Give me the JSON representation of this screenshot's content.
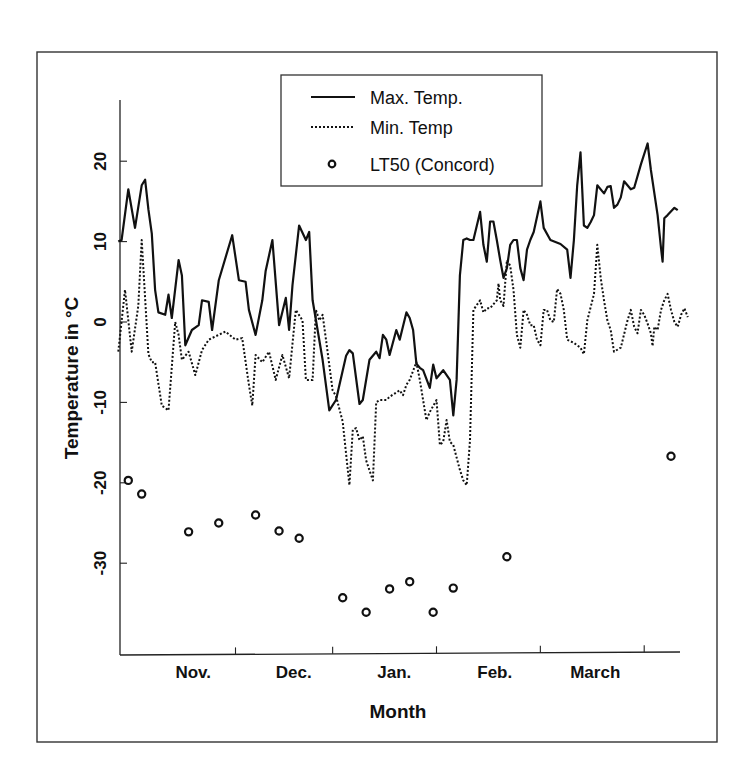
{
  "chart_data": {
    "type": "line",
    "title": "",
    "xlabel": "Month",
    "ylabel": "Temperature in °C",
    "ylim": [
      -40,
      28
    ],
    "yticks": [
      20,
      10,
      0,
      -10,
      -20,
      -30
    ],
    "x_unit": "day index (0 = 1 Nov)",
    "xlim": [
      -4,
      162
    ],
    "month_boundaries": [
      30,
      59,
      90,
      121,
      152
    ],
    "month_labels": [
      {
        "label": "Nov.",
        "x": 15
      },
      {
        "label": "Dec.",
        "x": 45
      },
      {
        "label": "Jan.",
        "x": 75
      },
      {
        "label": "Feb.",
        "x": 105
      },
      {
        "label": "March",
        "x": 135
      }
    ],
    "grid": false,
    "legend_position": "top-center",
    "legend": [
      {
        "label": "Max. Temp.",
        "style": "solid"
      },
      {
        "label": "Min. Temp",
        "style": "dotted"
      },
      {
        "label": "LT50 (Concord)",
        "style": "open-circle"
      }
    ],
    "series": [
      {
        "name": "Max. Temp.",
        "style": "solid",
        "points": [
          [
            -5,
            10
          ],
          [
            -4,
            10.2
          ],
          [
            -2,
            16.5
          ],
          [
            0,
            11.7
          ],
          [
            2,
            17
          ],
          [
            3,
            17.7
          ],
          [
            4,
            14
          ],
          [
            5,
            11
          ],
          [
            6,
            4
          ],
          [
            7,
            1.2
          ],
          [
            9,
            0.9
          ],
          [
            10,
            3.4
          ],
          [
            11,
            0.5
          ],
          [
            13,
            7.7
          ],
          [
            14,
            5.8
          ],
          [
            15,
            -2.9
          ],
          [
            17,
            -1
          ],
          [
            19,
            -0.4
          ],
          [
            20,
            2.7
          ],
          [
            22,
            2.5
          ],
          [
            23,
            -1
          ],
          [
            25,
            5.2
          ],
          [
            29,
            10.8
          ],
          [
            31,
            5.2
          ],
          [
            33,
            5
          ],
          [
            34,
            1.5
          ],
          [
            36,
            -1.6
          ],
          [
            38,
            2.7
          ],
          [
            39,
            6.3
          ],
          [
            41,
            10.2
          ],
          [
            43,
            -0.4
          ],
          [
            45,
            3
          ],
          [
            46,
            -1
          ],
          [
            47,
            4.6
          ],
          [
            49,
            12
          ],
          [
            51,
            10.2
          ],
          [
            52,
            11.2
          ],
          [
            53,
            2.7
          ],
          [
            56,
            -4.7
          ],
          [
            58,
            -11
          ],
          [
            60,
            -9.7
          ],
          [
            63,
            -4.2
          ],
          [
            64,
            -3.5
          ],
          [
            65,
            -3.9
          ],
          [
            67,
            -10.2
          ],
          [
            68,
            -9.7
          ],
          [
            70,
            -4.7
          ],
          [
            72,
            -3.7
          ],
          [
            73,
            -4.5
          ],
          [
            74,
            -1.6
          ],
          [
            75,
            -2.2
          ],
          [
            76,
            -4.1
          ],
          [
            78,
            -1
          ],
          [
            79,
            -2.2
          ],
          [
            81,
            1.2
          ],
          [
            82,
            0.5
          ],
          [
            83,
            -1
          ],
          [
            84,
            -5.2
          ],
          [
            85,
            -5.7
          ],
          [
            86,
            -6
          ],
          [
            88,
            -8.2
          ],
          [
            89,
            -5.3
          ],
          [
            90,
            -7
          ],
          [
            92,
            -6
          ],
          [
            94,
            -7.2
          ],
          [
            95,
            -11.6
          ],
          [
            96,
            -7.2
          ],
          [
            97,
            5.8
          ],
          [
            98,
            10.2
          ],
          [
            99,
            10.4
          ],
          [
            100,
            10.2
          ],
          [
            101,
            10.2
          ],
          [
            103,
            13.7
          ],
          [
            104,
            9.6
          ],
          [
            105,
            7.5
          ],
          [
            106,
            12.5
          ],
          [
            107,
            12.5
          ],
          [
            108,
            10.2
          ],
          [
            109,
            7.7
          ],
          [
            110,
            5.5
          ],
          [
            111,
            6.7
          ],
          [
            112,
            9.6
          ],
          [
            113,
            10.2
          ],
          [
            114,
            10.2
          ],
          [
            115,
            6.7
          ],
          [
            116,
            5.2
          ],
          [
            117,
            9
          ],
          [
            118,
            10.2
          ],
          [
            119,
            11.2
          ],
          [
            121,
            15
          ],
          [
            122,
            11.7
          ],
          [
            124,
            10.2
          ],
          [
            127,
            9.7
          ],
          [
            129,
            9
          ],
          [
            130,
            5.5
          ],
          [
            131,
            10.2
          ],
          [
            132,
            17
          ],
          [
            133,
            21.1
          ],
          [
            134,
            12
          ],
          [
            135,
            11.7
          ],
          [
            136,
            12.4
          ],
          [
            137,
            13.3
          ],
          [
            138,
            17
          ],
          [
            140,
            16
          ],
          [
            141,
            16.8
          ],
          [
            142,
            16.9
          ],
          [
            143,
            14.2
          ],
          [
            144,
            14.6
          ],
          [
            145,
            15.5
          ],
          [
            146,
            17.5
          ],
          [
            148,
            16.5
          ],
          [
            149,
            16.7
          ],
          [
            151,
            19.6
          ],
          [
            153,
            22.2
          ],
          [
            154,
            18.9
          ],
          [
            156,
            13.3
          ],
          [
            157,
            9.2
          ],
          [
            157.5,
            7.5
          ],
          [
            158,
            12.9
          ],
          [
            159,
            13.3
          ],
          [
            161,
            14.2
          ],
          [
            162,
            13.9
          ]
        ]
      },
      {
        "name": "Min. Temp",
        "style": "dotted",
        "points": [
          [
            -5,
            -3.7
          ],
          [
            -3,
            4
          ],
          [
            -1,
            -3.7
          ],
          [
            1,
            2
          ],
          [
            2,
            10.2
          ],
          [
            4,
            -4
          ],
          [
            5,
            -5
          ],
          [
            6,
            -5
          ],
          [
            8,
            -10.4
          ],
          [
            10,
            -11
          ],
          [
            12,
            0
          ],
          [
            13,
            -1.6
          ],
          [
            14,
            -4.7
          ],
          [
            16,
            -3.7
          ],
          [
            18,
            -6.6
          ],
          [
            20,
            -3.5
          ],
          [
            22,
            -2.2
          ],
          [
            27,
            -1.2
          ],
          [
            30,
            -2.2
          ],
          [
            32,
            -2
          ],
          [
            34,
            -7.8
          ],
          [
            35,
            -10.4
          ],
          [
            36,
            -4.1
          ],
          [
            38,
            -5
          ],
          [
            40,
            -3.7
          ],
          [
            42,
            -7.2
          ],
          [
            44,
            -4.1
          ],
          [
            46,
            -7
          ],
          [
            48,
            1.5
          ],
          [
            50,
            0.2
          ],
          [
            51,
            -7.2
          ],
          [
            53,
            -7.2
          ],
          [
            54,
            1.5
          ],
          [
            55,
            0.2
          ],
          [
            56,
            0.9
          ],
          [
            57,
            -2.2
          ],
          [
            59,
            -8.5
          ],
          [
            60,
            -9.2
          ],
          [
            62,
            -12.4
          ],
          [
            64,
            -20.3
          ],
          [
            65,
            -13.4
          ],
          [
            66,
            -13.2
          ],
          [
            67,
            -14.7
          ],
          [
            68,
            -14.2
          ],
          [
            69,
            -17.2
          ],
          [
            71,
            -19.7
          ],
          [
            72,
            -10
          ],
          [
            73,
            -9.7
          ],
          [
            75,
            -9.7
          ],
          [
            76,
            -9.3
          ],
          [
            79,
            -8.5
          ],
          [
            80,
            -9.1
          ],
          [
            81,
            -7.8
          ],
          [
            82,
            -7.2
          ],
          [
            84,
            -5
          ],
          [
            85,
            -7.2
          ],
          [
            87,
            -12.2
          ],
          [
            88,
            -11.2
          ],
          [
            90,
            -9.7
          ],
          [
            91,
            -15.3
          ],
          [
            92,
            -14.9
          ],
          [
            93,
            -12.2
          ],
          [
            94,
            -14.9
          ],
          [
            95,
            -15.3
          ],
          [
            97,
            -18.4
          ],
          [
            98,
            -19.7
          ],
          [
            99,
            -20.3
          ],
          [
            100,
            -14.7
          ],
          [
            101,
            1.5
          ],
          [
            103,
            2.7
          ],
          [
            104,
            1.2
          ],
          [
            105,
            1.7
          ],
          [
            106,
            1.7
          ],
          [
            108,
            2.7
          ],
          [
            108.5,
            4.8
          ],
          [
            109,
            2.7
          ],
          [
            110,
            2
          ],
          [
            111,
            7.7
          ],
          [
            112,
            7
          ],
          [
            113,
            4
          ],
          [
            114,
            -1.6
          ],
          [
            115,
            -3.2
          ],
          [
            116,
            1.5
          ],
          [
            117,
            0.9
          ],
          [
            118,
            -0.4
          ],
          [
            119,
            -0.4
          ],
          [
            120,
            -2.2
          ],
          [
            121,
            -2.9
          ],
          [
            122,
            1.5
          ],
          [
            123,
            1.5
          ],
          [
            124,
            0.2
          ],
          [
            125,
            0
          ],
          [
            126,
            4.1
          ],
          [
            127,
            3.5
          ],
          [
            128,
            1.5
          ],
          [
            129,
            -2.2
          ],
          [
            131,
            -2.6
          ],
          [
            133,
            -3.2
          ],
          [
            134,
            -4
          ],
          [
            135,
            0.2
          ],
          [
            137,
            3.5
          ],
          [
            138,
            9.6
          ],
          [
            139,
            5.5
          ],
          [
            140,
            2.7
          ],
          [
            141,
            0.2
          ],
          [
            142,
            -1
          ],
          [
            143,
            -3.7
          ],
          [
            145,
            -3.2
          ],
          [
            147,
            0.2
          ],
          [
            148,
            1.5
          ],
          [
            149,
            -0.6
          ],
          [
            150,
            -1.4
          ],
          [
            151,
            1.5
          ],
          [
            152,
            0.9
          ],
          [
            153,
            -0.2
          ],
          [
            154,
            -1.4
          ],
          [
            154.5,
            -3
          ],
          [
            155,
            -0.6
          ],
          [
            156,
            -1
          ],
          [
            157,
            1.5
          ],
          [
            158,
            2.7
          ],
          [
            159,
            3.5
          ],
          [
            160,
            1.5
          ],
          [
            161,
            0
          ],
          [
            162,
            -0.6
          ],
          [
            163,
            0.9
          ],
          [
            164,
            1.7
          ],
          [
            165,
            0.6
          ]
        ]
      },
      {
        "name": "LT50 (Concord)",
        "style": "markers",
        "points": [
          [
            -2,
            -19.7
          ],
          [
            2,
            -21.4
          ],
          [
            16,
            -26.1
          ],
          [
            25,
            -25
          ],
          [
            36,
            -24
          ],
          [
            43,
            -26
          ],
          [
            49,
            -26.9
          ],
          [
            62,
            -34.3
          ],
          [
            69,
            -36.1
          ],
          [
            76,
            -33.2
          ],
          [
            82,
            -32.3
          ],
          [
            89,
            -36.1
          ],
          [
            95,
            -33.1
          ],
          [
            111,
            -29.2
          ],
          [
            160,
            -16.7
          ]
        ]
      }
    ]
  }
}
